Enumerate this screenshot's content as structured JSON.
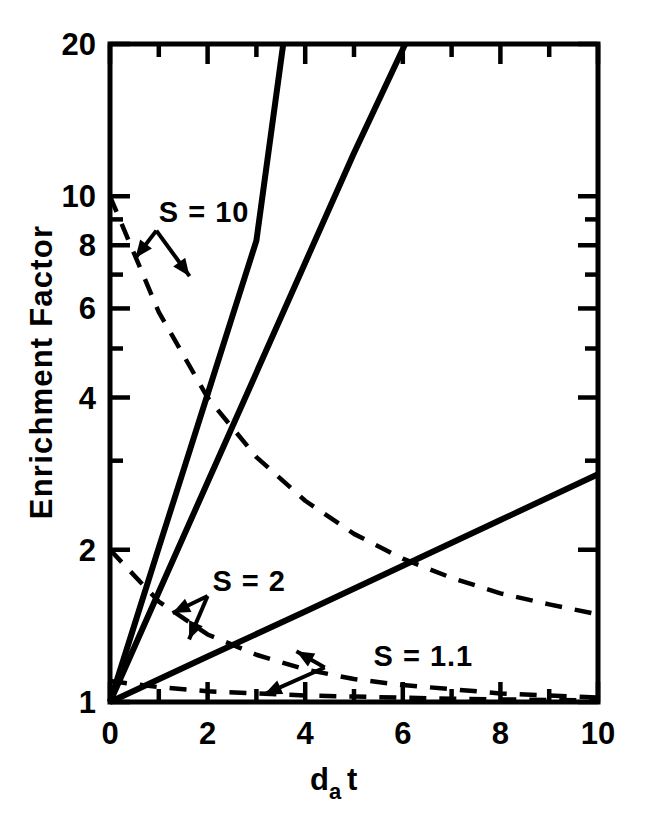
{
  "figure": {
    "background_color": "#ffffff",
    "ink_color": "#000000",
    "width": 645,
    "height": 824
  },
  "chart_data": {
    "type": "line",
    "title": "",
    "subtitle": "",
    "xlabel": "d_a t",
    "xlabel_parts": {
      "base": "d",
      "subscript": "a",
      "tail": "t"
    },
    "ylabel": "Enrichment Factor",
    "xscale": "linear",
    "yscale": "log",
    "xlim": [
      0,
      10
    ],
    "ylim": [
      1,
      20
    ],
    "grid": false,
    "legend_position": "inline-annotations",
    "xticks": [
      0,
      2,
      4,
      6,
      8,
      10
    ],
    "xticklabels": [
      "0",
      "2",
      "4",
      "6",
      "8",
      "10"
    ],
    "xminorticks": [
      1,
      3,
      5,
      7,
      9
    ],
    "yticks": [
      1,
      2,
      4,
      6,
      8,
      10,
      20
    ],
    "yticklabels": [
      "1",
      "2",
      "4",
      "6",
      "8",
      "10",
      "20"
    ],
    "yminorticks": [
      3,
      5,
      7,
      9
    ],
    "annotations": [
      {
        "text": "S = 10",
        "x": 1.0,
        "y": 9.2
      },
      {
        "text": "S = 2",
        "x": 2.1,
        "y": 1.72
      },
      {
        "text": "S = 1.1",
        "x": 5.4,
        "y": 1.22
      }
    ],
    "series": [
      {
        "name": "S = 10 enrichment (solid)",
        "style": "solid",
        "x": [
          0,
          0.5,
          1.0,
          1.5,
          2.0,
          2.5,
          3.0,
          3.55
        ],
        "y": [
          1.0,
          1.42,
          2.02,
          2.86,
          4.06,
          5.76,
          8.17,
          20.0
        ]
      },
      {
        "name": "S = 2 enrichment (solid)",
        "style": "solid",
        "x": [
          0,
          1,
          2,
          3,
          4,
          5,
          6.05
        ],
        "y": [
          1.0,
          1.65,
          2.72,
          4.48,
          7.39,
          12.18,
          20.0
        ]
      },
      {
        "name": "S = 1.1 enrichment (solid)",
        "style": "solid",
        "x": [
          0,
          2,
          4,
          6,
          8,
          10
        ],
        "y": [
          1.0,
          1.23,
          1.51,
          1.86,
          2.29,
          2.82
        ]
      },
      {
        "name": "S = 10 depletion (dashed)",
        "style": "dashed",
        "x": [
          0,
          1,
          2,
          3,
          4,
          5,
          6,
          7,
          8,
          9,
          10
        ],
        "y": [
          10.0,
          5.9,
          4.0,
          3.05,
          2.5,
          2.15,
          1.92,
          1.76,
          1.64,
          1.56,
          1.49
        ]
      },
      {
        "name": "S = 2 depletion (dashed)",
        "style": "dashed",
        "x": [
          0,
          1,
          2,
          3,
          4,
          5,
          6,
          7,
          8,
          9,
          10
        ],
        "y": [
          2.0,
          1.58,
          1.36,
          1.24,
          1.16,
          1.11,
          1.08,
          1.06,
          1.04,
          1.03,
          1.02
        ]
      },
      {
        "name": "S = 1.1 depletion (dashed)",
        "style": "dashed",
        "x": [
          0,
          1,
          2,
          3,
          4,
          5,
          6,
          7,
          8,
          9,
          10
        ],
        "y": [
          1.1,
          1.07,
          1.05,
          1.04,
          1.03,
          1.025,
          1.02,
          1.015,
          1.012,
          1.009,
          1.007
        ]
      }
    ]
  }
}
